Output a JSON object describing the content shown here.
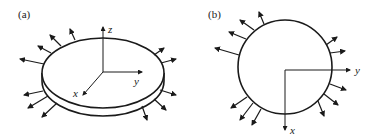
{
  "figure": {
    "panels": [
      {
        "label": "(a)",
        "description": "disk (thin plate) in 3D view with radial outward arrows around rim",
        "axes": {
          "x": "x",
          "y": "y",
          "z": "z"
        }
      },
      {
        "label": "(b)",
        "description": "circle in plan view with radial outward arrows around rim",
        "axes": {
          "x": "x",
          "y": "y"
        }
      }
    ],
    "colors": {
      "stroke": "#1a1a1a",
      "background": "#ffffff"
    }
  }
}
